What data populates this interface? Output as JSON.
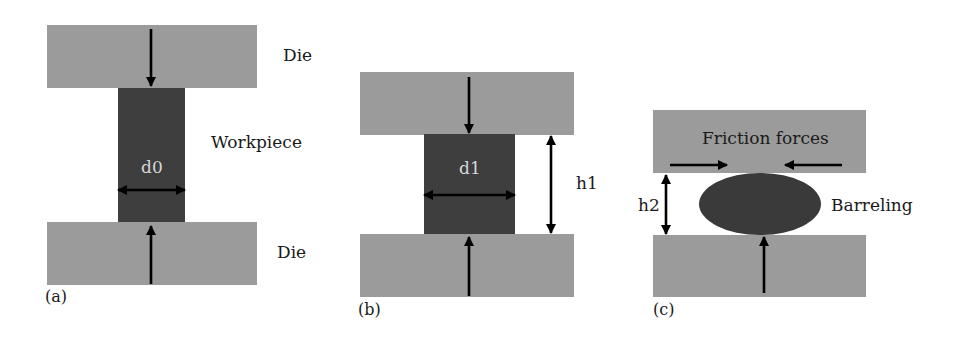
{
  "figure": {
    "colors": {
      "die": "#9b9b9b",
      "workpiece": "#3e3e3e",
      "arrow": "#000000",
      "text": "#1a1a1a",
      "workpiece_text": "#d8d8d8"
    },
    "panels": [
      {
        "id": "a",
        "panel_label": "(a)",
        "top_die_label": "Die",
        "workpiece_label": "Workpiece",
        "bottom_die_label": "Die",
        "diameter_label": "d0"
      },
      {
        "id": "b",
        "panel_label": "(b)",
        "diameter_label": "d1",
        "height_label": "h1"
      },
      {
        "id": "c",
        "panel_label": "(c)",
        "friction_label": "Friction forces",
        "height_label": "h2",
        "barreling_label": "Barreling"
      }
    ]
  }
}
